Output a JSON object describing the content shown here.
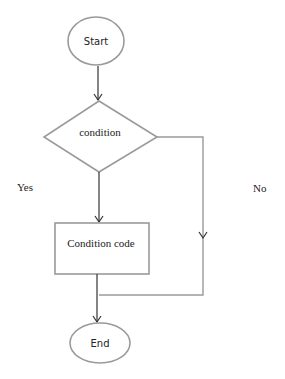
{
  "diagram": {
    "type": "flowchart",
    "nodes": {
      "start": {
        "shape": "ellipse",
        "label": "Start"
      },
      "condition": {
        "shape": "diamond",
        "label": "condition"
      },
      "condition_code": {
        "shape": "rectangle",
        "label": "Condition code"
      },
      "end": {
        "shape": "ellipse",
        "label": "End"
      }
    },
    "branch_labels": {
      "yes": "Yes",
      "no": "No"
    },
    "edges": [
      {
        "from": "start",
        "to": "condition"
      },
      {
        "from": "condition",
        "to": "condition_code",
        "label": "Yes"
      },
      {
        "from": "condition",
        "to": "end",
        "label": "No"
      },
      {
        "from": "condition_code",
        "to": "end"
      }
    ],
    "colors": {
      "shape_stroke": "#9a9a9a",
      "arrow_stroke": "#333333",
      "background": "#ffffff"
    }
  }
}
